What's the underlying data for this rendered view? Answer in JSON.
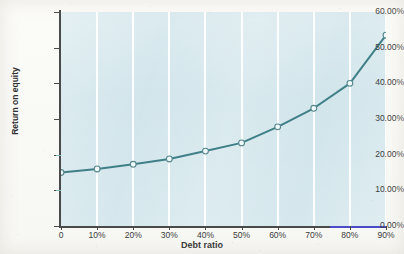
{
  "chart_data": {
    "type": "line",
    "title": "",
    "xlabel": "Debt ratio",
    "ylabel": "Return on equity",
    "x": [
      0,
      10,
      20,
      30,
      40,
      50,
      60,
      70,
      80,
      90
    ],
    "xtick_labels": [
      "0",
      "10%",
      "20%",
      "30%",
      "40%",
      "50%",
      "60%",
      "70%",
      "80%",
      "90%"
    ],
    "values": [
      15.0,
      16.0,
      17.3,
      18.8,
      21.0,
      23.3,
      27.8,
      33.0,
      40.0,
      53.5
    ],
    "ytick_labels": [
      "60.00%",
      "50.00%",
      "40.00%",
      "30.00%",
      "20.00%",
      "10.00%",
      "0.00%"
    ],
    "ytick_values": [
      60,
      50,
      40,
      30,
      20,
      10,
      0
    ],
    "ylim": [
      0,
      60
    ],
    "xlim": [
      0,
      90
    ],
    "grid": "vertical-only",
    "legend": "none",
    "series": [
      {
        "name": "Return on equity",
        "values": [
          15.0,
          16.0,
          17.3,
          18.8,
          21.0,
          23.3,
          27.8,
          33.0,
          40.0,
          53.5
        ]
      }
    ],
    "colors": {
      "plot_background": "#cfe4ea",
      "gridline": "#ffffff",
      "line": "#3f7f87",
      "marker_fill": "#f2fbfb",
      "marker_stroke": "#54868c",
      "axis": "#4a4a4a",
      "axis_accent": "#4b4bc8",
      "text": "#3b3b3b"
    }
  }
}
